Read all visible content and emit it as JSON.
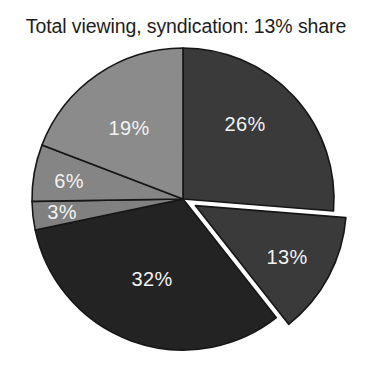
{
  "figure": {
    "supertitle": "",
    "title": "Total viewing, syndication: 13% share",
    "background": "#ffffff"
  },
  "chart_data": {
    "type": "pie",
    "title": "Total viewing, syndication: 13% share",
    "xlabel": "",
    "ylabel": "",
    "start_angle_deg": 0,
    "direction": "clockwise",
    "legend": "none",
    "grid": false,
    "labels_inside": true,
    "center": {
      "x": 183,
      "y": 199
    },
    "radius": 151,
    "categories": [
      "26%",
      "13%",
      "32%",
      "3%",
      "6%",
      "19%"
    ],
    "values": [
      26,
      13,
      32,
      3,
      6,
      19
    ],
    "total": 99,
    "slices": [
      {
        "label": "26%",
        "value": 26,
        "color": "#3a3a3a",
        "exploded": false,
        "explode_offset": 0,
        "label_x": 245,
        "label_y": 126
      },
      {
        "label": "13%",
        "value": 13,
        "color": "#3a3a3a",
        "exploded": true,
        "explode_offset": 14,
        "label_x": 287,
        "label_y": 259
      },
      {
        "label": "32%",
        "value": 32,
        "color": "#232323",
        "exploded": false,
        "explode_offset": 0,
        "label_x": 152,
        "label_y": 281
      },
      {
        "label": "3%",
        "value": 3,
        "color": "#808080",
        "exploded": false,
        "explode_offset": 0,
        "label_x": 62,
        "label_y": 214
      },
      {
        "label": "6%",
        "value": 6,
        "color": "#858585",
        "exploded": false,
        "explode_offset": 0,
        "label_x": 69,
        "label_y": 183
      },
      {
        "label": "19%",
        "value": 19,
        "color": "#8b8b8b",
        "exploded": false,
        "explode_offset": 0,
        "label_x": 129,
        "label_y": 130
      }
    ],
    "colors": {
      "dark": "#3a3a3a",
      "darkest": "#232323",
      "mid_gray": "#858585",
      "outline": "#161616",
      "label_text": "#f2f2f2",
      "title_text": "#1d1d1d",
      "background": "#ffffff"
    }
  }
}
